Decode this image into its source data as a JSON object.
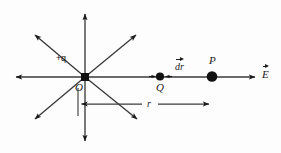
{
  "figure": {
    "background_color": "#fdfdfd",
    "stroke_color": "#1a1a1a"
  },
  "labels": {
    "charge": "+q",
    "origin": "O",
    "point_q": "Q",
    "point_p": "P",
    "displacement": "dr",
    "field": "E",
    "distance": "r"
  },
  "geometry": {
    "origin": {
      "x": 85,
      "y": 77
    },
    "field_lines": [
      {
        "name": "up",
        "tip_x": 85,
        "tip_y": 11
      },
      {
        "name": "down",
        "tip_x": 85,
        "tip_y": 144
      },
      {
        "name": "left",
        "tip_x": 12,
        "tip_y": 77
      },
      {
        "name": "upper-left",
        "tip_x": 32,
        "tip_y": 32
      },
      {
        "name": "upper-right",
        "tip_x": 139,
        "tip_y": 32
      },
      {
        "name": "lower-left",
        "tip_x": 32,
        "tip_y": 122
      },
      {
        "name": "lower-right",
        "tip_x": 140,
        "tip_y": 122
      }
    ],
    "axis_arrow": {
      "from_x": 85,
      "from_y": 77,
      "tip_x": 259,
      "tip_y": 77
    },
    "charge_dot": {
      "x": 85,
      "y": 77,
      "r": 4.2
    },
    "q_dot": {
      "x": 160,
      "y": 76,
      "r": 4.0
    },
    "p_dot": {
      "x": 212,
      "y": 76,
      "r": 5.2
    },
    "dimension_line": {
      "from_x": 78,
      "to_x": 213,
      "y": 104
    }
  }
}
